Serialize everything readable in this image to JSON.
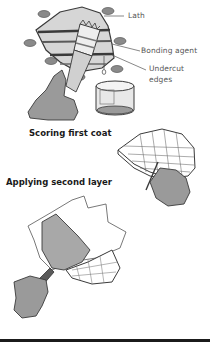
{
  "figure_1": {
    "labels": {
      "lath": "Lath",
      "bonding_agent": "Bonding agent",
      "undercut_line1": "Undercut",
      "undercut_line2": "edges"
    },
    "icons": [
      "plaster-hole-icon",
      "brush-icon",
      "hand-icon",
      "bonding-can-icon"
    ]
  },
  "figure_2": {
    "caption": "Scoring first coat",
    "icons": [
      "scored-patch-icon",
      "scoring-tool-icon",
      "hand-icon"
    ]
  },
  "figure_3": {
    "caption": "Applying second layer",
    "icons": [
      "trowel-icon",
      "hand-icon",
      "patch-icon"
    ]
  },
  "colors": {
    "gray_fill": "#9a9a9a",
    "dark_gray": "#6e6e6e",
    "light_gray": "#d8d8d8",
    "outline": "#3a3a3a",
    "bottom_bar": "#1b1b1b"
  }
}
